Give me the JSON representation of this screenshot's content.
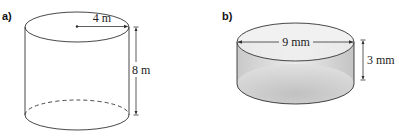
{
  "figures": [
    {
      "label": "a)",
      "shape": "cylinder",
      "radius_label": "4 m",
      "height_label": "8 m",
      "fill": "none"
    },
    {
      "label": "b)",
      "shape": "cylinder",
      "diameter_label": "9 mm",
      "height_label": "3 mm",
      "fill": "shaded-gray"
    }
  ],
  "colors": {
    "stroke": "#333333",
    "shade_top": "#eeeeee",
    "shade_side": "#d0d0d0"
  }
}
